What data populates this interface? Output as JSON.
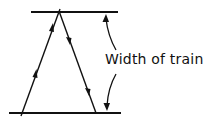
{
  "diagram": {
    "label": "Width of train",
    "colors": {
      "stroke": "#111111",
      "background": "#ffffff"
    },
    "elements": {
      "top_line": {
        "x1": 31,
        "y1": 12,
        "x2": 118,
        "y2": 12
      },
      "bottom_line": {
        "x1": 9,
        "y1": 113,
        "x2": 121,
        "y2": 113
      },
      "left_leg": {
        "x1": 21,
        "y1": 115,
        "x2": 59,
        "y2": 11,
        "direction": "up"
      },
      "right_leg": {
        "x1": 59,
        "y1": 11,
        "x2": 96,
        "y2": 113,
        "direction": "down"
      },
      "width_arrow_top": {
        "from": "label",
        "to": "top_line",
        "tip": [
          105,
          16
        ]
      },
      "width_arrow_bottom": {
        "from": "label",
        "to": "bottom_line",
        "tip": [
          106,
          110
        ]
      }
    }
  }
}
